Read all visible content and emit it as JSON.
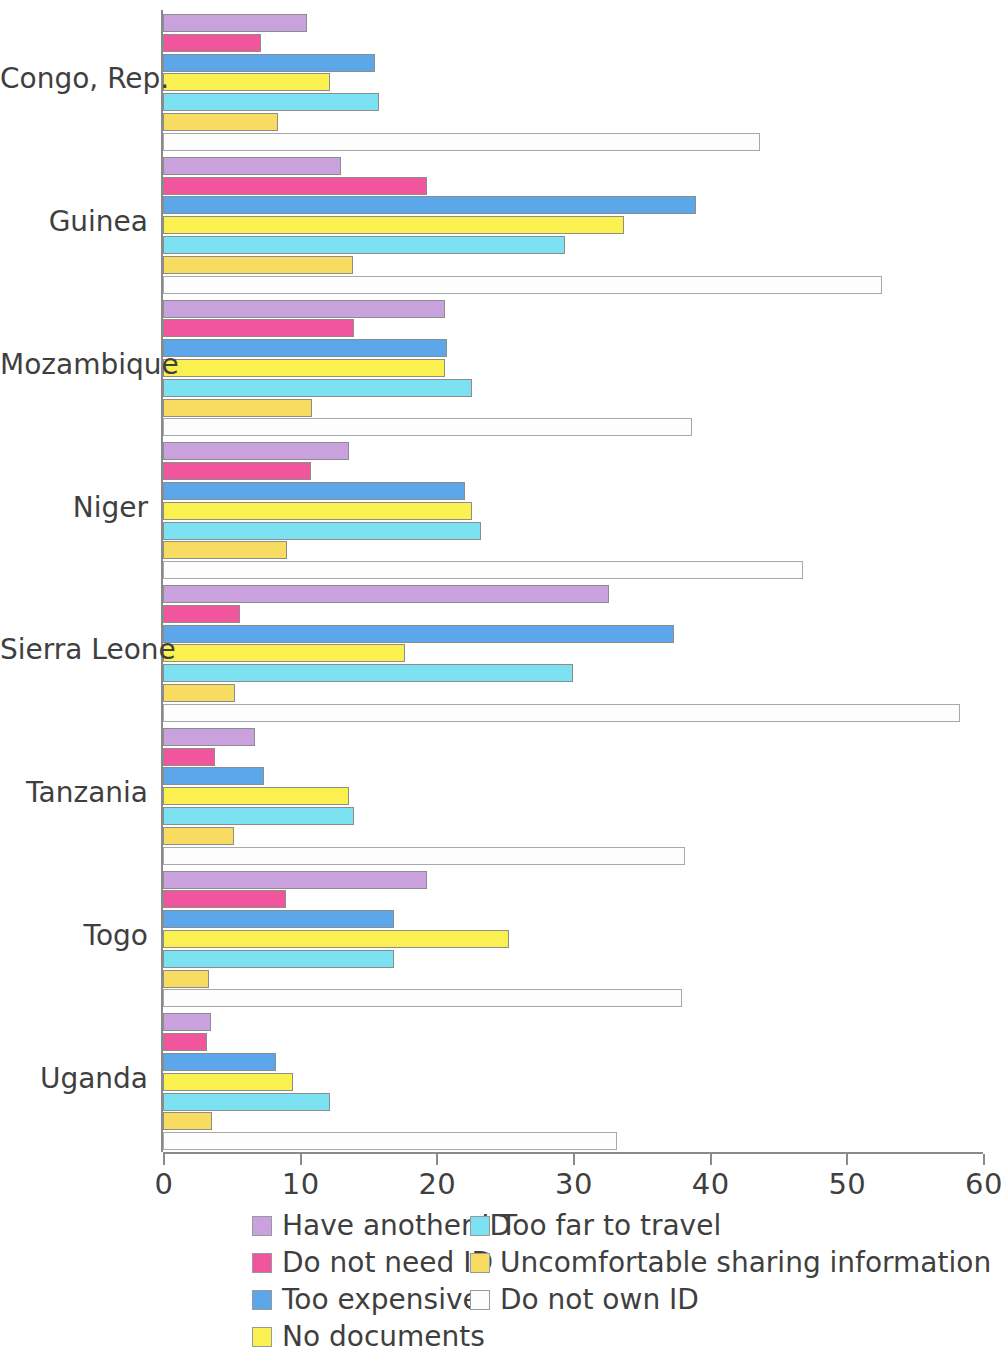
{
  "chart_data": {
    "type": "bar",
    "orientation": "horizontal",
    "grouped": true,
    "title": "",
    "subtitle": "",
    "xlabel": "",
    "ylabel": "",
    "xlim": [
      0,
      60
    ],
    "x_ticks": [
      0,
      10,
      20,
      30,
      40,
      50,
      60
    ],
    "x_tick_labels": [
      "0",
      "10",
      "20",
      "30",
      "40",
      "50",
      "60"
    ],
    "grid": false,
    "legend_position": "bottom",
    "categories": [
      "Congo, Rep.",
      "Guinea",
      "Mozambique",
      "Niger",
      "Sierra Leone",
      "Tanzania",
      "Togo",
      "Uganda"
    ],
    "series": [
      {
        "name": "Have another ID",
        "color": "#c9a2dd",
        "values": [
          10.5,
          13.0,
          20.6,
          13.6,
          32.6,
          6.7,
          19.3,
          3.5
        ]
      },
      {
        "name": "Do not need ID",
        "color": "#f0559d",
        "values": [
          7.2,
          19.3,
          14.0,
          10.8,
          5.6,
          3.8,
          9.0,
          3.2
        ]
      },
      {
        "name": "Too expensive",
        "color": "#5ba7ea",
        "values": [
          15.5,
          39.0,
          20.8,
          22.1,
          37.4,
          7.4,
          16.9,
          8.3
        ]
      },
      {
        "name": "No documents",
        "color": "#faf050",
        "values": [
          12.2,
          33.7,
          20.6,
          22.6,
          17.7,
          13.6,
          25.3,
          9.5
        ]
      },
      {
        "name": "Too far to travel",
        "color": "#7ce2f2",
        "values": [
          15.8,
          29.4,
          22.6,
          23.3,
          30.0,
          14.0,
          16.9,
          12.2
        ]
      },
      {
        "name": "Uncomfortable sharing information",
        "color": "#f8dc62",
        "values": [
          8.4,
          13.9,
          10.9,
          9.1,
          5.3,
          5.2,
          3.4,
          3.6
        ]
      },
      {
        "name": "Do not own ID",
        "color": "#fdfdfd",
        "values": [
          43.7,
          52.6,
          38.7,
          46.8,
          58.3,
          38.2,
          38.0,
          33.2
        ]
      }
    ]
  },
  "legend": {
    "column_1": [
      {
        "label": "Have another ID",
        "color": "#c9a2dd"
      },
      {
        "label": "Do not need ID",
        "color": "#f0559d"
      },
      {
        "label": "Too expensive",
        "color": "#5ba7ea"
      },
      {
        "label": "No documents",
        "color": "#faf050"
      }
    ],
    "column_2": [
      {
        "label": "Too far to travel",
        "color": "#7ce2f2"
      },
      {
        "label": "Uncomfortable sharing information",
        "color": "#f8dc62"
      },
      {
        "label": "Do not own ID",
        "color": "#fdfdfd"
      }
    ]
  }
}
